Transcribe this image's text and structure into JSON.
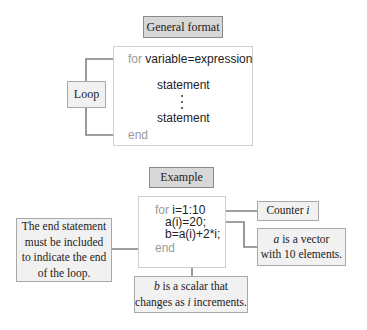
{
  "general": {
    "title": "General format",
    "loop_label": "Loop",
    "code": {
      "for_kw": "for",
      "for_expr": "variable=expression",
      "statement1": "statement",
      "statement2": "statement",
      "end_kw": "end"
    }
  },
  "example": {
    "title": "Example",
    "code": {
      "for_kw": "for",
      "for_expr": "i=1:10",
      "line2": "a(i)=20;",
      "line3": "b=a(i)+2*i;",
      "end_kw": "end"
    },
    "callouts": {
      "end_note": "The end statement must be included to indicate the end of the loop.",
      "counter_prefix": "Counter ",
      "counter_var": "i",
      "vector_var": "a",
      "vector_text_1": " is a vector",
      "vector_text_2": "with 10 elements.",
      "scalar_var": "b",
      "scalar_text_1": " is a scalar that",
      "scalar_text_2": "changes as ",
      "scalar_var2": "i",
      "scalar_text_3": " increments."
    }
  },
  "colors": {
    "title_fill": "#d8d8d8",
    "callout_fill": "#f1f1f1",
    "arrow": "#808080",
    "keyword": "#9a9a9a"
  }
}
